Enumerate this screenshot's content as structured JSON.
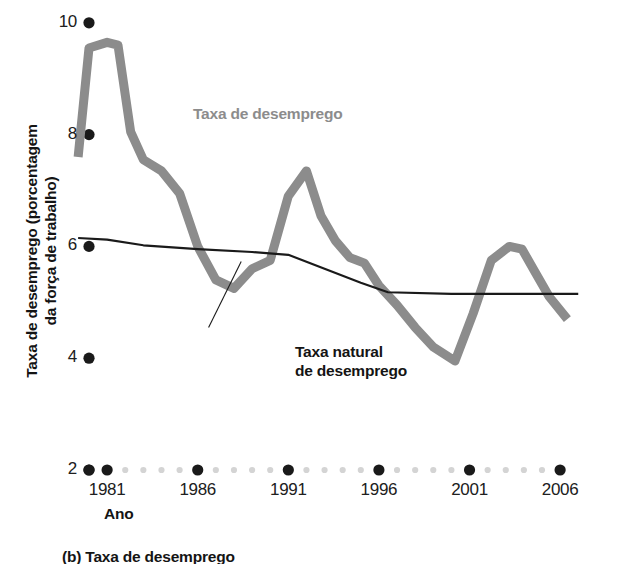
{
  "chart_data": {
    "type": "line",
    "title": "",
    "xlabel": "Ano",
    "ylabel": "Taxa de desemprego (porcentagem\nda força de trabalho)",
    "xlim": [
      1979.4,
      2007.0
    ],
    "ylim": [
      2,
      10
    ],
    "grid": false,
    "legend_position": "inline-annotations",
    "xticks": [
      "1981",
      "1986",
      "1991",
      "1996",
      "2001",
      "2006"
    ],
    "xtick_values": [
      1981,
      1986,
      1991,
      1996,
      2001,
      2006
    ],
    "yticks": [
      "10",
      "8",
      "6",
      "4",
      "2"
    ],
    "ytick_values": [
      10,
      8,
      6,
      4,
      2
    ],
    "minor_xtick_style": "dotted-light-gray",
    "series": [
      {
        "name": "Taxa de desemprego",
        "color": "#8c8c8c",
        "line_width": 9,
        "x": [
          1979.4,
          1980.0,
          1981.0,
          1981.6,
          1982.3,
          1983.0,
          1984.0,
          1985.0,
          1986.0,
          1987.0,
          1988.0,
          1989.0,
          1990.0,
          1991.0,
          1992.0,
          1992.8,
          1993.6,
          1994.4,
          1995.2,
          1996.0,
          1997.0,
          1998.0,
          1999.0,
          2000.2,
          2001.2,
          2002.2,
          2003.2,
          2003.9,
          2004.6,
          2005.4,
          2006.4
        ],
        "y": [
          7.6,
          9.55,
          9.65,
          9.6,
          8.05,
          7.55,
          7.35,
          6.95,
          6.0,
          5.4,
          5.25,
          5.6,
          5.75,
          6.9,
          7.35,
          6.55,
          6.1,
          5.8,
          5.7,
          5.3,
          4.95,
          4.55,
          4.2,
          3.95,
          4.8,
          5.75,
          6.0,
          5.95,
          5.55,
          5.1,
          4.7
        ]
      },
      {
        "name": "Taxa natural de desemprego",
        "color": "#1a1a1a",
        "line_width": 2.2,
        "x": [
          1979.4,
          1981.0,
          1983.0,
          1986.0,
          1989.0,
          1991.0,
          1993.0,
          1995.0,
          1996.5,
          2000.0,
          2003.0,
          2006.0,
          2007.0
        ],
        "y": [
          6.15,
          6.12,
          6.02,
          5.95,
          5.9,
          5.85,
          5.6,
          5.35,
          5.18,
          5.15,
          5.15,
          5.15,
          5.15
        ]
      }
    ],
    "annotations": [
      {
        "name": "unemployment-rate-label",
        "text": "Taxa de desemprego",
        "color": "#8c8c8c",
        "x": 1981.9,
        "y": 8.45
      },
      {
        "name": "natural-rate-label",
        "text": "Taxa natural\nde desemprego",
        "color": "#1a1a1a",
        "x": 1987.6,
        "y": 4.2,
        "leader_line": {
          "from_x": 1986.6,
          "from_y": 4.55,
          "to_x": 1988.4,
          "to_y": 5.73
        }
      }
    ]
  },
  "axis": {
    "y_label": "Taxa de desemprego (porcentagem\nda força de trabalho)",
    "x_label": "Ano"
  },
  "caption": {
    "text": "(b) Taxa de desemprego"
  },
  "colors": {
    "unemployment_series": "#8c8c8c",
    "natural_series": "#1a1a1a",
    "tick_major": "#1a1a1a",
    "tick_minor": "#d4d4d4",
    "background": "#ffffff"
  }
}
